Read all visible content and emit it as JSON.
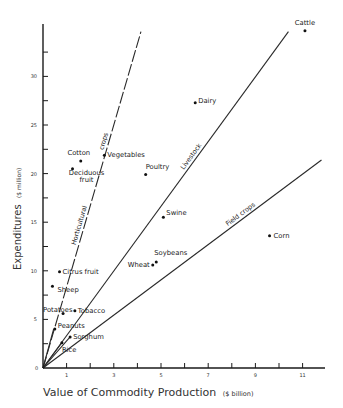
{
  "chart_data": {
    "type": "scatter",
    "title": "",
    "xlabel": "Value of Commodity Production",
    "xlabel_unit": "($ billion)",
    "ylabel": "Expenditures",
    "ylabel_unit": "($ million)",
    "xlim": [
      0,
      12
    ],
    "ylim": [
      0,
      35.5
    ],
    "x_ticks": [
      1,
      2,
      3,
      4,
      5,
      6,
      7,
      8,
      9,
      10,
      11
    ],
    "x_tick_labels": [
      "1",
      "",
      "3",
      "",
      "5",
      "",
      "7",
      "",
      "9",
      "",
      "11"
    ],
    "y_ticks": [
      2.5,
      5,
      7.5,
      10,
      12.5,
      15,
      17.5,
      20,
      22.5,
      25,
      27.5,
      30,
      32.5
    ],
    "y_tick_labels": [
      "",
      "5",
      "",
      "10",
      "",
      "15",
      "",
      "20",
      "",
      "25",
      "",
      "30",
      ""
    ],
    "origin_label": "0",
    "grid": false,
    "legend": "none",
    "points": [
      {
        "label": "Cattle",
        "x": 11.1,
        "y": 34.7
      },
      {
        "label": "Dairy",
        "x": 6.45,
        "y": 27.3
      },
      {
        "label": "Vegetables",
        "x": 2.6,
        "y": 21.9
      },
      {
        "label": "Cotton",
        "x": 1.6,
        "y": 21.3
      },
      {
        "label": "Deciduous fruit",
        "x": 1.25,
        "y": 20.5
      },
      {
        "label": "Poultry",
        "x": 4.35,
        "y": 19.9
      },
      {
        "label": "Swine",
        "x": 5.1,
        "y": 15.5
      },
      {
        "label": "Corn",
        "x": 9.6,
        "y": 13.6
      },
      {
        "label": "Soybeans",
        "x": 4.8,
        "y": 10.9
      },
      {
        "label": "Wheat",
        "x": 4.65,
        "y": 10.6
      },
      {
        "label": "Citrus fruit",
        "x": 0.7,
        "y": 9.9
      },
      {
        "label": "Sheep",
        "x": 0.4,
        "y": 8.4
      },
      {
        "label": "Tobacco",
        "x": 1.35,
        "y": 5.9
      },
      {
        "label": "Potatoes",
        "x": 0.85,
        "y": 5.6
      },
      {
        "label": "Peanuts",
        "x": 0.5,
        "y": 4.0
      },
      {
        "label": "Sorghum",
        "x": 1.15,
        "y": 3.2
      },
      {
        "label": "Rice",
        "x": 0.8,
        "y": 2.6
      }
    ],
    "reference_lines": [
      {
        "label": "Horticultural crops",
        "x_end": 4.15,
        "y_end": 34.6,
        "style": "dashed"
      },
      {
        "label": "Livestock",
        "x_end": 10.4,
        "y_end": 34.6,
        "style": "solid"
      },
      {
        "label": "Field crops",
        "x_end": 11.8,
        "y_end": 21.4,
        "style": "solid"
      }
    ],
    "line_label_parts": {
      "horticultural": "Horticultural",
      "crops": "crops",
      "livestock": "Livestock",
      "field_crops": "Field crops"
    }
  }
}
